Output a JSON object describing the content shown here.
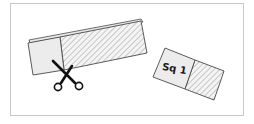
{
  "figure": {
    "cut_piece_label": "Sq 1",
    "icons": {
      "scissors": "scissors-icon"
    },
    "colors": {
      "frame": "#c8c8c8",
      "outline": "#4a4a4a",
      "fill_plain": "#ececec",
      "hatch_line": "#b4b4b4",
      "background": "#ffffff",
      "scissors": "#111111"
    }
  }
}
